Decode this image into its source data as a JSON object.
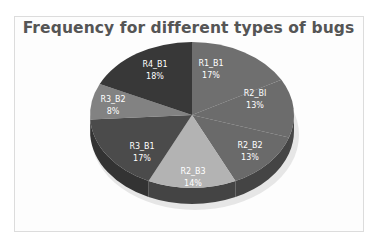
{
  "chart_data": {
    "type": "pie",
    "title": "Frequency for different types of bugs",
    "categories": [
      "R1_B1",
      "R2_BI",
      "R2_B2",
      "R2_B3",
      "R3_B1",
      "R3_B2",
      "R4_B1"
    ],
    "values": [
      17,
      13,
      13,
      14,
      17,
      8,
      18
    ],
    "value_labels": [
      "17%",
      "13%",
      "13%",
      "14%",
      "17%",
      "8%",
      "18%"
    ],
    "unit": "%",
    "style": "3d-pie",
    "legend": "none (labels on slices)",
    "start_angle_deg": 0,
    "direction": "clockwise"
  },
  "colors": {
    "slices": [
      "#6f6f6f",
      "#6c6c6c",
      "#6a6a6a",
      "#b3b3b3",
      "#4b4b4b",
      "#828282",
      "#383838"
    ],
    "sides": [
      "#4a4a4a",
      "#474747",
      "#444444",
      "#444444",
      "#333333",
      "#575757",
      "#262626"
    ],
    "title": "#555555",
    "label": "#ffffff"
  }
}
